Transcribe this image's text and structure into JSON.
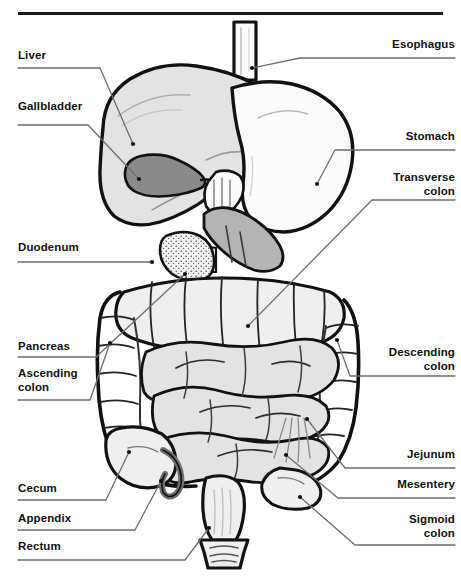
{
  "figure": {
    "rule_color": "#1a1a1a",
    "background": "#ffffff"
  },
  "palette": {
    "outline": "#111111",
    "organ_light": "#e3e3e3",
    "organ_lighter": "#efefef",
    "organ_white": "#fbfbfb",
    "gallbladder_gray": "#8a8a8a",
    "duodenum_gray": "#b4b4b4",
    "appendix_gray": "#6f6f6f",
    "leader": "#6e6e6e",
    "text": "#111111"
  },
  "labels": {
    "left": [
      {
        "name": "liver",
        "text": "Liver",
        "x": 18,
        "y": 48,
        "width": 90,
        "underline_to": 100,
        "dot": [
          133,
          144
        ]
      },
      {
        "name": "gallbladder",
        "text": "Gallbladder",
        "x": 18,
        "y": 99,
        "width": 90,
        "underline_to": 88,
        "dot": [
          139,
          179
        ]
      },
      {
        "name": "duodenum",
        "text": "Duodenum",
        "x": 18,
        "y": 240,
        "width": 90,
        "underline_to": 152,
        "dot": [
          152,
          261
        ]
      },
      {
        "name": "pancreas",
        "text": "Pancreas",
        "x": 18,
        "y": 339,
        "width": 90,
        "underline_to": 96,
        "dot": [
          185,
          274
        ]
      },
      {
        "name": "ascending-colon",
        "text": "Ascending\ncolon",
        "x": 18,
        "y": 366,
        "width": 90,
        "underline_to": 90,
        "dot": [
          110,
          343
        ]
      },
      {
        "name": "cecum",
        "text": "Cecum",
        "x": 18,
        "y": 481,
        "width": 90,
        "underline_to": 106,
        "dot": [
          129,
          452
        ]
      },
      {
        "name": "appendix",
        "text": "Appendix",
        "x": 18,
        "y": 511,
        "width": 90,
        "underline_to": 135,
        "dot": [
          161,
          481
        ]
      },
      {
        "name": "rectum",
        "text": "Rectum",
        "x": 18,
        "y": 539,
        "width": 90,
        "underline_to": 185,
        "dot": [
          209,
          528
        ]
      }
    ],
    "right": [
      {
        "name": "esophagus",
        "text": "Esophagus",
        "x": 363,
        "y": 37,
        "width": 92,
        "underline_to": 300,
        "dot": [
          252,
          68
        ]
      },
      {
        "name": "stomach",
        "text": "Stomach",
        "x": 363,
        "y": 129,
        "width": 92,
        "underline_to": 335,
        "dot": [
          317,
          184
        ]
      },
      {
        "name": "transverse-colon",
        "text": "Transverse\ncolon",
        "x": 363,
        "y": 170,
        "width": 92,
        "underline_to": 372,
        "dot": [
          248,
          326
        ]
      },
      {
        "name": "descending-colon",
        "text": "Descending\ncolon",
        "x": 363,
        "y": 345,
        "width": 92,
        "underline_to": 350,
        "dot": [
          337,
          340
        ]
      },
      {
        "name": "jejunum",
        "text": "Jejunum",
        "x": 363,
        "y": 447,
        "width": 92,
        "underline_to": 345,
        "dot": [
          307,
          419
        ]
      },
      {
        "name": "mesentery",
        "text": "Mesentery",
        "x": 363,
        "y": 477,
        "width": 92,
        "underline_to": 338,
        "dot": [
          286,
          455
        ]
      },
      {
        "name": "sigmoid-colon",
        "text": "Sigmoid\ncolon",
        "x": 363,
        "y": 512,
        "width": 92,
        "underline_to": 355,
        "dot": [
          300,
          497
        ]
      }
    ]
  },
  "organs": [
    {
      "name": "esophagus",
      "fill": "#fbfbfb"
    },
    {
      "name": "liver",
      "fill": "#e3e3e3"
    },
    {
      "name": "gallbladder",
      "fill": "#8a8a8a"
    },
    {
      "name": "stomach",
      "fill": "#fbfbfb"
    },
    {
      "name": "duodenum",
      "fill": "#b4b4b4"
    },
    {
      "name": "pancreas",
      "fill": "#efefef"
    },
    {
      "name": "transverse-colon",
      "fill": "#efefef"
    },
    {
      "name": "ascending-colon",
      "fill": "#efefef"
    },
    {
      "name": "descending-colon",
      "fill": "#efefef"
    },
    {
      "name": "jejunum",
      "fill": "#e3e3e3"
    },
    {
      "name": "cecum",
      "fill": "#efefef"
    },
    {
      "name": "appendix",
      "fill": "#6f6f6f"
    },
    {
      "name": "sigmoid-colon",
      "fill": "#efefef"
    },
    {
      "name": "rectum",
      "fill": "#efefef"
    }
  ]
}
